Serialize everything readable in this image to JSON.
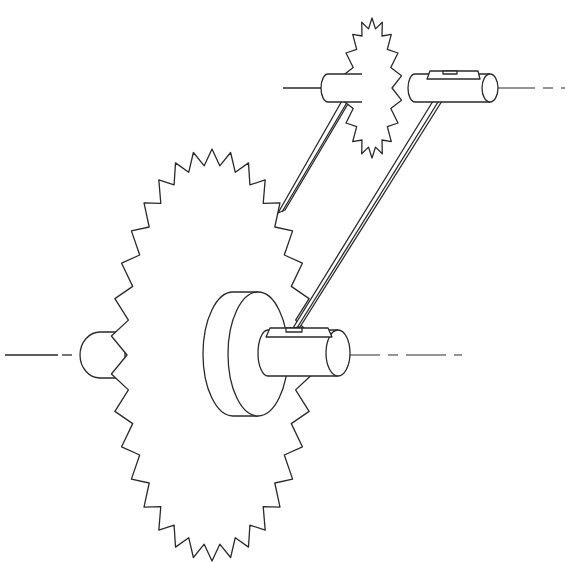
{
  "diagram": {
    "type": "mechanical line drawing",
    "components": [
      {
        "name": "large-sprocket",
        "teeth_approx": 34
      },
      {
        "name": "small-sprocket",
        "teeth_approx": 18
      },
      {
        "name": "drive-shaft-large"
      },
      {
        "name": "drive-shaft-small"
      },
      {
        "name": "hub"
      },
      {
        "name": "key-large"
      },
      {
        "name": "key-small"
      },
      {
        "name": "chain-strand-upper"
      },
      {
        "name": "chain-strand-lower"
      },
      {
        "name": "centerline-large"
      },
      {
        "name": "centerline-small"
      }
    ],
    "colors": {
      "line": "#2a2a2a",
      "background": "#ffffff"
    }
  }
}
